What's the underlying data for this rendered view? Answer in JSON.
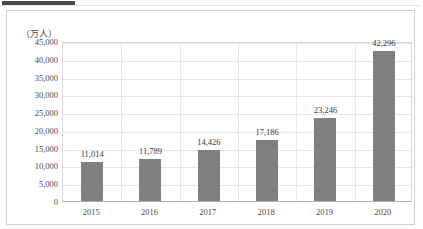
{
  "figure": {
    "accent_color": "#4a4a4a",
    "bar_color": "#808080",
    "axis_unit": "（万人）"
  },
  "chart_data": {
    "type": "bar",
    "title": "",
    "subtitle": "",
    "xlabel": "",
    "ylabel": "（万人）",
    "categories": [
      "2015",
      "2016",
      "2017",
      "2018",
      "2019",
      "2020"
    ],
    "values": [
      11014,
      11789,
      14426,
      17186,
      23246,
      42296
    ],
    "value_labels": [
      "11,014",
      "11,789",
      "14,426",
      "17,186",
      "23,246",
      "42,296"
    ],
    "ylim": [
      0,
      45000
    ],
    "ytick_labels": [
      "45,000",
      "40,000",
      "35,000",
      "30,000",
      "25,000",
      "20,000",
      "15,000",
      "10,000",
      "5,000",
      "0"
    ],
    "ytick_values": [
      45000,
      40000,
      35000,
      30000,
      25000,
      20000,
      15000,
      10000,
      5000,
      0
    ],
    "grid": "both",
    "legend": "none"
  }
}
